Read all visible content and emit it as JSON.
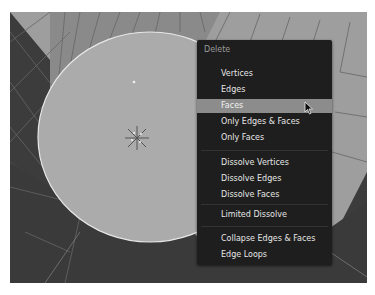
{
  "menu": {
    "title": "Delete",
    "items": [
      {
        "label": "Vertices",
        "top": 27
      },
      {
        "label": "Edges",
        "top": 43
      },
      {
        "label": "Faces",
        "top": 59,
        "active": true
      },
      {
        "label": "Only Edges & Faces",
        "top": 75
      },
      {
        "label": "Only Faces",
        "top": 91
      },
      {
        "label": "Dissolve Vertices",
        "top": 116
      },
      {
        "label": "Dissolve Edges",
        "top": 132
      },
      {
        "label": "Dissolve Faces",
        "top": 148
      },
      {
        "label": "Limited Dissolve",
        "top": 168
      },
      {
        "label": "Collapse Edges & Faces",
        "top": 192
      },
      {
        "label": "Edge Loops",
        "top": 208
      }
    ],
    "separators": [
      110,
      163,
      186
    ]
  },
  "colors": {
    "menu_bg": "#1e1e1e",
    "highlight": "#8c8c8c",
    "text": "#e6e6e6",
    "title_text": "#9a9a9a",
    "mesh_face": "#a8a8a8",
    "background_dark": "#3a3a3a"
  }
}
